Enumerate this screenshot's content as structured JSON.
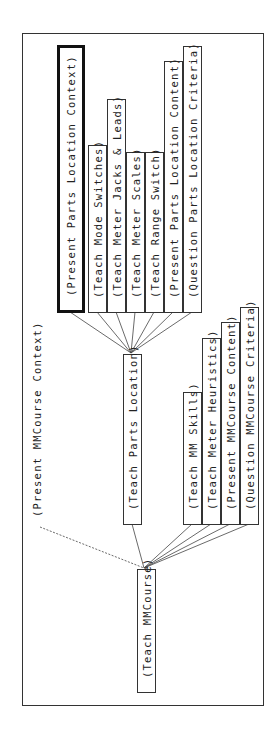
{
  "diagram": {
    "type": "goal-tree",
    "orientation": "rotated-90-ccw",
    "root": {
      "label": "(Teach MMCourse)",
      "children": [
        {
          "label": "(Present MMCourse Context)",
          "boxed": false,
          "edge": "dashed"
        },
        {
          "label": "(Teach Parts Location)",
          "boxed": true,
          "children": [
            {
              "label": "(Present Parts Location Context)",
              "focused": true
            },
            {
              "label": "(Teach Mode Switches)"
            },
            {
              "label": "(Teach Meter Jacks & Leads)"
            },
            {
              "label": "(Teach Meter Scales)"
            },
            {
              "label": "(Teach Range Switch)"
            },
            {
              "label": "(Present Parts Location Content)"
            },
            {
              "label": "(Question Parts Location Criteria)"
            }
          ]
        },
        {
          "label": "(Teach MM Skills)"
        },
        {
          "label": "(Teach Meter Heuristics)"
        },
        {
          "label": "(Present MMCourse Content)"
        },
        {
          "label": "(Question MMCourse Criteria)"
        }
      ]
    },
    "nodes": {
      "present_parts_location_context": "(Present Parts Location Context)",
      "teach_mode_switches": "(Teach Mode Switches)",
      "teach_meter_jacks_leads": "(Teach Meter Jacks & Leads)",
      "teach_meter_scales": "(Teach Meter Scales)",
      "teach_range_switch": "(Teach Range Switch)",
      "present_parts_location_content": "(Present Parts Location Content)",
      "question_parts_location_criteria": "(Question Parts Location Criteria)",
      "teach_parts_location": "(Teach Parts Location)",
      "teach_mm_skills": "(Teach MM Skills)",
      "teach_meter_heuristics": "(Teach Meter Heuristics)",
      "present_mmcourse_content": "(Present MMCourse Content)",
      "question_mmcourse_criteria": "(Question MMCourse Criteria)",
      "teach_mmcourse": "(Teach MMCourse)",
      "present_mmcourse_context": "(Present MMCourse Context)"
    },
    "colors": {
      "line": "#333333",
      "focus_border": "#111111",
      "background": "#ffffff"
    }
  }
}
